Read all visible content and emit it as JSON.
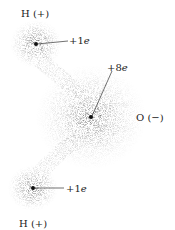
{
  "diagram": {
    "atoms": [
      {
        "id": "h_top",
        "label": "H (+)",
        "charge_prefix": "+1",
        "charge_unit": "e",
        "cx": 36,
        "cy": 44
      },
      {
        "id": "o",
        "label": "O (−)",
        "charge_prefix": "+8",
        "charge_unit": "e",
        "cx": 91,
        "cy": 117
      },
      {
        "id": "h_bottom",
        "label": "H (+)",
        "charge_prefix": "+1",
        "charge_unit": "e",
        "cx": 33,
        "cy": 188
      }
    ]
  }
}
